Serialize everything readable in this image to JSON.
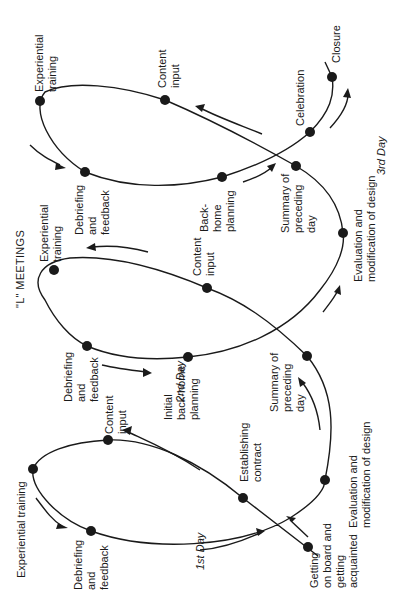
{
  "title": "\"L\" MEETINGS",
  "days": [
    {
      "label": "1st Day",
      "nodes": [
        {
          "id": "getting-on-board",
          "lines": [
            "Getting",
            "on board and",
            "getting",
            "acquainted"
          ]
        },
        {
          "id": "establishing-contract",
          "lines": [
            "Establishing",
            "contract"
          ]
        },
        {
          "id": "content-input",
          "lines": [
            "Content",
            "input"
          ]
        },
        {
          "id": "experiential-training",
          "lines": [
            "Experiential training"
          ]
        },
        {
          "id": "debriefing-feedback",
          "lines": [
            "Debriefing",
            "and",
            "feedback"
          ]
        },
        {
          "id": "evaluation-modification",
          "lines": [
            "Evaluation and",
            "modification of design"
          ]
        }
      ]
    },
    {
      "label": "2nd Day",
      "nodes": [
        {
          "id": "summary-preceding-day",
          "lines": [
            "Summary of",
            "preceding",
            "day"
          ]
        },
        {
          "id": "content-input",
          "lines": [
            "Content",
            "input"
          ]
        },
        {
          "id": "experiential-training",
          "lines": [
            "Experiential",
            "training"
          ]
        },
        {
          "id": "debriefing-feedback",
          "lines": [
            "Debriefing",
            "and",
            "feedback"
          ]
        },
        {
          "id": "initial-back-home-planning",
          "lines": [
            "Initial",
            "back-home",
            "planning"
          ]
        },
        {
          "id": "evaluation-modification",
          "lines": [
            "Evaluation and",
            "modification of design"
          ]
        }
      ]
    },
    {
      "label": "3rd Day",
      "nodes": [
        {
          "id": "summary-preceding-day",
          "lines": [
            "Summary of",
            "preceding",
            "day"
          ]
        },
        {
          "id": "content-input",
          "lines": [
            "Content",
            "input"
          ]
        },
        {
          "id": "experiential-training",
          "lines": [
            "Experiential",
            "training"
          ]
        },
        {
          "id": "debriefing-feedback",
          "lines": [
            "Debriefing",
            "and",
            "feedback"
          ]
        },
        {
          "id": "back-home-planning",
          "lines": [
            "Back-",
            "home",
            "planning"
          ]
        },
        {
          "id": "celebration",
          "lines": [
            "Celebration"
          ]
        },
        {
          "id": "closure",
          "lines": [
            "Closure"
          ]
        }
      ]
    }
  ]
}
